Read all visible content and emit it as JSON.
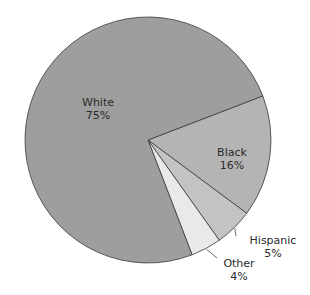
{
  "chart_data": {
    "type": "pie",
    "title": "",
    "categories": [
      "White",
      "Black",
      "Hispanic",
      "Other"
    ],
    "values": [
      75,
      16,
      5,
      4
    ],
    "labels": [
      "75%",
      "16%",
      "5%",
      "4%"
    ],
    "colors": [
      "#9e9e9e",
      "#b4b4b4",
      "#c3c3c3",
      "#e9e9e9"
    ],
    "start_angle_deg": -21,
    "direction": "clockwise",
    "legend": "none",
    "label_placement": {
      "White": "inside",
      "Black": "inside",
      "Hispanic": "outside-leader",
      "Other": "outside-leader"
    }
  },
  "slices": [
    {
      "name": "White",
      "pct": "75%"
    },
    {
      "name": "Black",
      "pct": "16%"
    },
    {
      "name": "Hispanic",
      "pct": "5%"
    },
    {
      "name": "Other",
      "pct": "4%"
    }
  ]
}
